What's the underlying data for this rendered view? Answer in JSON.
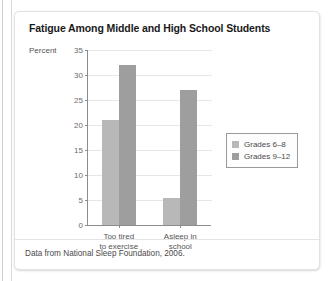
{
  "figure": {
    "title": "Fatigue Among Middle and High School Students",
    "source_note": "Data from National Sleep Foundation, 2006.",
    "colors": {
      "series_light": "#b8b8b8",
      "series_dark": "#9e9e9e",
      "axis": "#8c8c8c",
      "grid": "#e6e6e6",
      "card_border": "#e2e2e2"
    }
  },
  "chart_data": {
    "type": "bar",
    "title": "Fatigue Among Middle and High School Students",
    "subtitle": "",
    "xlabel": "",
    "ylabel": "Percent",
    "ylim": [
      0,
      35
    ],
    "yticks": [
      0,
      5,
      10,
      15,
      20,
      25,
      30,
      35
    ],
    "ytick_labels": [
      "0",
      "5",
      "10",
      "15",
      "20",
      "25",
      "30",
      "35"
    ],
    "grid": true,
    "grid_axis": "y",
    "legend_position": "right",
    "categories": [
      "Too tired to exercise",
      "Asleep in school"
    ],
    "category_label_lines": [
      [
        "Too tired",
        "to exercise"
      ],
      [
        "Asleep in",
        "school"
      ]
    ],
    "series": [
      {
        "name": "Grades 6–8",
        "color": "#b8b8b8",
        "values": [
          21,
          5.5
        ]
      },
      {
        "name": "Grades 9–12",
        "color": "#9e9e9e",
        "values": [
          32,
          27
        ]
      }
    ],
    "annotations": [
      "Data from National Sleep Foundation, 2006."
    ]
  }
}
